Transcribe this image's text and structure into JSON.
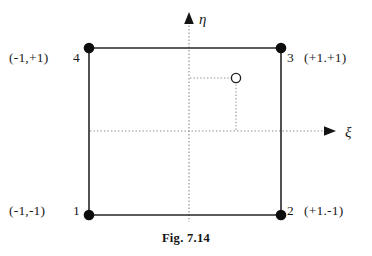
{
  "figure": {
    "caption": "Fig. 7.14"
  },
  "axes": {
    "horizontal": {
      "symbol": "ξ",
      "name": "xi",
      "arrow_direction": "right",
      "style": "dotted"
    },
    "vertical": {
      "symbol": "η",
      "name": "eta",
      "arrow_direction": "up",
      "style": "dotted"
    }
  },
  "element": {
    "shape": "square",
    "edge_style": "solid",
    "nodes": [
      {
        "number": "1",
        "position": "bottom-left",
        "coordinate_label": "(-1,-1)",
        "marker": "filled-circle"
      },
      {
        "number": "2",
        "position": "bottom-right",
        "coordinate_label": "(+1.-1)",
        "marker": "filled-circle"
      },
      {
        "number": "3",
        "position": "top-right",
        "coordinate_label": "(+1.+1)",
        "marker": "filled-circle"
      },
      {
        "number": "4",
        "position": "top-left",
        "coordinate_label": "(-1,+1)",
        "marker": "filled-circle"
      }
    ]
  },
  "interior_point": {
    "marker": "hollow-circle",
    "projection_style": "dotted",
    "has_eta_projection": true,
    "has_xi_projection": true
  },
  "colors": {
    "ink": "#1a1a1a",
    "line": "#2b2b2b",
    "dotted": "#808080",
    "background": "#ffffff"
  }
}
